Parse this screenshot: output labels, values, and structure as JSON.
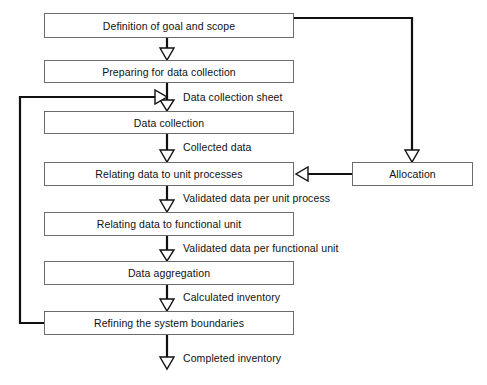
{
  "diagram": {
    "colors": {
      "box_border": "#6b6b6b",
      "box_fill": "#ffffff",
      "connector": "#111111",
      "background": "#ffffff"
    },
    "nodes": [
      {
        "id": "definition-of-goal-and-scope",
        "label": "Definition of goal and scope",
        "x": 44,
        "y": 13,
        "w": 250,
        "h": 25
      },
      {
        "id": "preparing-for-data-collection",
        "label": "Preparing for data collection",
        "x": 44,
        "y": 60,
        "w": 250,
        "h": 23
      },
      {
        "id": "data-collection",
        "label": "Data collection",
        "x": 44,
        "y": 111,
        "w": 250,
        "h": 23
      },
      {
        "id": "relating-data-to-unit-processes",
        "label": "Relating data to unit processes",
        "x": 44,
        "y": 162,
        "w": 250,
        "h": 24
      },
      {
        "id": "relating-data-to-functional-unit",
        "label": "Relating data to functional unit",
        "x": 44,
        "y": 212,
        "w": 250,
        "h": 24
      },
      {
        "id": "data-aggregation",
        "label": "Data aggregation",
        "x": 44,
        "y": 261,
        "w": 250,
        "h": 24
      },
      {
        "id": "refining-the-system-boundaries",
        "label": "Refining the system boundaries",
        "x": 44,
        "y": 311,
        "w": 250,
        "h": 24
      },
      {
        "id": "allocation",
        "label": "Allocation",
        "x": 352,
        "y": 162,
        "w": 121,
        "h": 24
      }
    ],
    "edge_labels": [
      {
        "id": "data-collection-sheet",
        "label": "Data collection sheet",
        "x": 183,
        "y": 89
      },
      {
        "id": "collected-data",
        "label": "Collected data",
        "x": 183,
        "y": 140
      },
      {
        "id": "validated-data-per-unit-process",
        "label": "Validated data per unit process",
        "x": 183,
        "y": 191
      },
      {
        "id": "validated-data-per-functional-unit",
        "label": "Validated data per functional unit",
        "x": 183,
        "y": 241
      },
      {
        "id": "calculated-inventory",
        "label": "Calculated inventory",
        "x": 183,
        "y": 290
      },
      {
        "id": "completed-inventory",
        "label": "Completed inventory",
        "x": 183,
        "y": 352
      }
    ]
  }
}
